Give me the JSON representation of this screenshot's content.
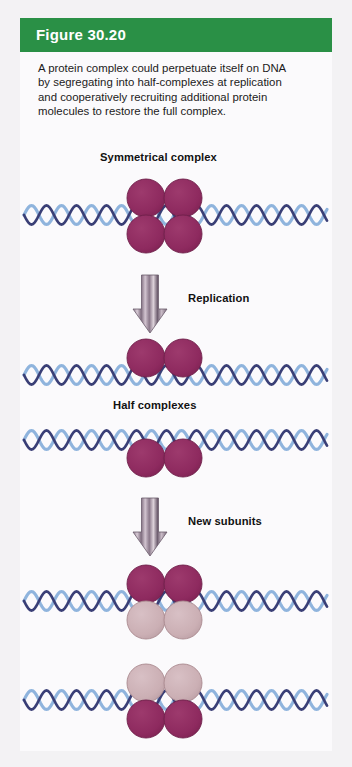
{
  "figure": {
    "number_label": "Figure 30.20",
    "header_color": "#2a9046",
    "panel_color": "#fbfafc",
    "page_background": "#f3f2f4",
    "caption": {
      "line1": "A protein complex could perpetuate itself on DNA",
      "line2": "by segregating into half-complexes at replication",
      "line3": "and cooperatively recruiting additional protein",
      "line4": "molecules to restore the full complex."
    }
  },
  "diagram": {
    "labels": {
      "symmetrical_complex": "Symmetrical complex",
      "replication": "Replication",
      "half_complexes": "Half complexes",
      "new_subunits": "New subunits"
    },
    "colors": {
      "protein_old": "#8e2a5f",
      "protein_old_edge": "#6e1f49",
      "protein_new": "#cbafb4",
      "protein_new_edge": "#a9898f",
      "dna_strand_dark": "#3a3f76",
      "dna_strand_light": "#8fb4dd",
      "arrow_body": "#b9a7b7",
      "arrow_stripe": "#6f5f70"
    },
    "steps": [
      {
        "name": "symmetrical-complex",
        "dna_y": 215,
        "subunits": [
          {
            "id": "top-left",
            "cx": 146,
            "cy": 198,
            "r": 19,
            "state": "old"
          },
          {
            "id": "top-right",
            "cx": 183,
            "cy": 198,
            "r": 19,
            "state": "old"
          },
          {
            "id": "bottom-left",
            "cx": 146,
            "cy": 234,
            "r": 19,
            "state": "old"
          },
          {
            "id": "bottom-right",
            "cx": 183,
            "cy": 234,
            "r": 19,
            "state": "old"
          }
        ]
      },
      {
        "name": "half-complex-upper",
        "dna_y": 375,
        "subunits": [
          {
            "id": "top-left",
            "cx": 146,
            "cy": 358,
            "r": 19,
            "state": "old"
          },
          {
            "id": "top-right",
            "cx": 183,
            "cy": 358,
            "r": 19,
            "state": "old"
          }
        ]
      },
      {
        "name": "half-complex-lower",
        "dna_y": 440,
        "subunits": [
          {
            "id": "bottom-left",
            "cx": 146,
            "cy": 458,
            "r": 19,
            "state": "old"
          },
          {
            "id": "bottom-right",
            "cx": 183,
            "cy": 458,
            "r": 19,
            "state": "old"
          }
        ]
      },
      {
        "name": "restored-complex-upper",
        "dna_y": 601,
        "subunits": [
          {
            "id": "top-left",
            "cx": 146,
            "cy": 584,
            "r": 19,
            "state": "old"
          },
          {
            "id": "top-right",
            "cx": 183,
            "cy": 584,
            "r": 19,
            "state": "old"
          },
          {
            "id": "bottom-left",
            "cx": 146,
            "cy": 620,
            "r": 19,
            "state": "new"
          },
          {
            "id": "bottom-right",
            "cx": 183,
            "cy": 620,
            "r": 19,
            "state": "new"
          }
        ]
      },
      {
        "name": "restored-complex-lower",
        "dna_y": 700,
        "subunits": [
          {
            "id": "top-left",
            "cx": 146,
            "cy": 683,
            "r": 19,
            "state": "new"
          },
          {
            "id": "top-right",
            "cx": 183,
            "cy": 683,
            "r": 19,
            "state": "new"
          },
          {
            "id": "bottom-left",
            "cx": 146,
            "cy": 719,
            "r": 19,
            "state": "old"
          },
          {
            "id": "bottom-right",
            "cx": 183,
            "cy": 719,
            "r": 19,
            "state": "old"
          }
        ]
      }
    ],
    "arrows": [
      {
        "name": "replication-arrow",
        "x": 150,
        "y_top": 275,
        "y_bottom": 333
      },
      {
        "name": "new-subunits-arrow",
        "x": 150,
        "y_top": 498,
        "y_bottom": 556
      }
    ]
  }
}
